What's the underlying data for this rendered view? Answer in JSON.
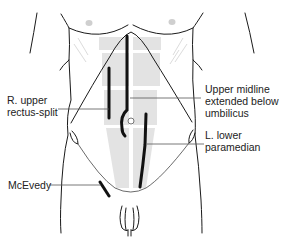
{
  "diagram": {
    "type": "anatomical illustration",
    "colors": {
      "outline": "#1a1a1a",
      "incision": "#111111",
      "rectus_fill": "#e3e3e3",
      "nipple": "#cfcfcf",
      "leader_line": "#555555",
      "text": "#222222"
    },
    "labels": {
      "r_upper_line1": "R. upper",
      "r_upper_line2": "rectus-split",
      "upper_midline_line1": "Upper midline",
      "upper_midline_line2": "extended below",
      "upper_midline_line3": "umbilicus",
      "l_lower_line1": "L. lower",
      "l_lower_line2": "paramedian",
      "mcevedy": "McEvedy"
    },
    "incisions": [
      {
        "name": "R. upper rectus-split",
        "side": "right"
      },
      {
        "name": "Upper midline extended below umbilicus",
        "side": "midline"
      },
      {
        "name": "L. lower paramedian",
        "side": "left"
      },
      {
        "name": "McEvedy",
        "side": "right groin"
      }
    ]
  }
}
